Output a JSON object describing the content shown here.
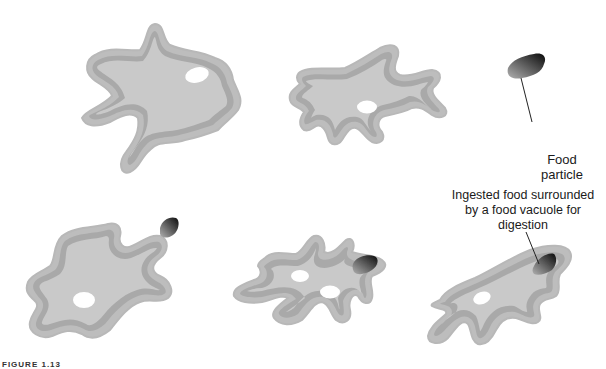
{
  "figure": {
    "caption": "FIGURE 1.13",
    "colors": {
      "cytoplasm": "#c8c8c8",
      "membrane_band": "#a8a8a8",
      "outer_edge": "#b5b5b5",
      "vacuole": "#ffffff",
      "food_dark": "#111111",
      "food_light": "#9a9a9a",
      "label_text": "#1a1a1a"
    },
    "labels": {
      "food_particle": [
        "Food",
        "particle"
      ],
      "ingested": [
        "Ingested food surrounded",
        "by a food vacuole for",
        "digestion"
      ]
    },
    "stages": [
      {
        "id": 1,
        "description": "Amoeba with one vacuole",
        "position": "top-left"
      },
      {
        "id": 2,
        "description": "Amoeba extending pseudopods toward food particle",
        "position": "top-middle"
      },
      {
        "id": 3,
        "description": "Pseudopod approaches food particle",
        "position": "bottom-left"
      },
      {
        "id": 4,
        "description": "Pseudopods surround food particle",
        "position": "bottom-middle"
      },
      {
        "id": 5,
        "description": "Food enclosed in food vacuole",
        "position": "bottom-right"
      }
    ]
  }
}
